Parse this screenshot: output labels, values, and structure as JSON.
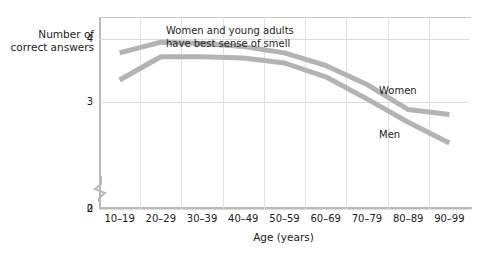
{
  "chart_data": {
    "type": "line",
    "title": "",
    "xlabel": "Age (years)",
    "ylabel": "Number of\ncorrect answers",
    "categories": [
      "10–19",
      "20–29",
      "30–39",
      "40–49",
      "50–59",
      "60–69",
      "70–79",
      "80–89",
      "90–99"
    ],
    "ylim": [
      0,
      4.35
    ],
    "yticks": [
      0,
      2,
      3,
      4
    ],
    "ytick_labels": [
      "0",
      "2",
      "3",
      "4"
    ],
    "y_axis_break": true,
    "y_axis_break_between": [
      0,
      2
    ],
    "grid": "both",
    "legend": "inline",
    "series": [
      {
        "name": "Women",
        "color": "#b3b3b3",
        "values": [
          3.78,
          3.95,
          3.93,
          3.88,
          3.78,
          3.58,
          3.28,
          2.88,
          2.8
        ]
      },
      {
        "name": "Men",
        "color": "#b3b3b3",
        "values": [
          3.35,
          3.72,
          3.72,
          3.7,
          3.62,
          3.4,
          3.05,
          2.68,
          2.35
        ]
      }
    ],
    "annotations": [
      {
        "name": "peak-callout",
        "text": "Women and young adults\nhave best sense of smell"
      }
    ]
  },
  "labels": {
    "series_women": "Women",
    "series_men": "Men",
    "annotation": "Women and young adults\nhave best sense of smell",
    "y_axis_title": "Number of\ncorrect answers",
    "x_axis_title": "Age (years)"
  },
  "colors": {
    "line": "#b3b3b3",
    "axis": "#b9b9b9",
    "grid": "#dcdcdc",
    "text": "#1a1a1a",
    "background": "#ffffff"
  }
}
